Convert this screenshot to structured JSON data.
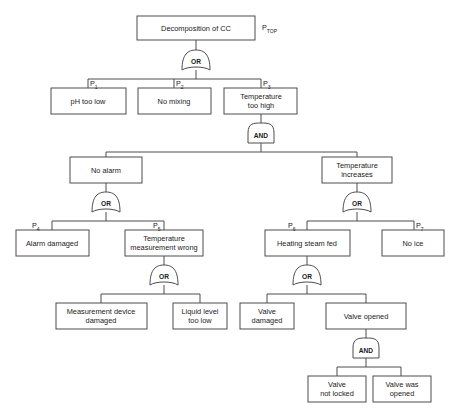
{
  "diagram": {
    "background_color": "#ffffff",
    "line_color": "#4c4c4c",
    "text_color": "#1a1a1a"
  },
  "gates": {
    "or_label": "OR",
    "and_label": "AND",
    "list": [
      {
        "id": "g-top",
        "type": "OR",
        "label": "OR"
      },
      {
        "id": "g-temp-too-high",
        "type": "AND",
        "label": "AND"
      },
      {
        "id": "g-no-alarm",
        "type": "OR",
        "label": "OR"
      },
      {
        "id": "g-temp-increases",
        "type": "OR",
        "label": "OR"
      },
      {
        "id": "g-temp-meas",
        "type": "OR",
        "label": "OR"
      },
      {
        "id": "g-heating-steam",
        "type": "OR",
        "label": "OR"
      },
      {
        "id": "g-valve-opened",
        "type": "AND",
        "label": "AND"
      }
    ]
  },
  "probability_labels": {
    "top": {
      "base": "P",
      "sub": "TOP",
      "text": "P TOP"
    },
    "p1": {
      "base": "P",
      "sub": "1",
      "text": "P 1"
    },
    "p2": {
      "base": "P",
      "sub": "2",
      "text": "P 2"
    },
    "p3": {
      "base": "P",
      "sub": "3",
      "text": "P 3"
    },
    "p4": {
      "base": "P",
      "sub": "4",
      "text": "P 4"
    },
    "p5": {
      "base": "P",
      "sub": "5",
      "text": "P 5"
    },
    "p6": {
      "base": "P",
      "sub": "6",
      "text": "P 6"
    },
    "p7": {
      "base": "P",
      "sub": "7",
      "text": "P 7"
    }
  },
  "nodes": {
    "top": {
      "id": "top",
      "lines": [
        "Decomposition of CC"
      ],
      "prob": "P TOP",
      "level": 0
    },
    "ph_too_low": {
      "id": "ph_too_low",
      "lines": [
        "pH too low"
      ],
      "prob": "P 1",
      "level": 1
    },
    "no_mixing": {
      "id": "no_mixing",
      "lines": [
        "No mixing"
      ],
      "prob": "P 2",
      "level": 1
    },
    "temp_too_high": {
      "id": "temp_too_high",
      "lines": [
        "Temperature",
        "too high"
      ],
      "prob": "P 3",
      "level": 1
    },
    "no_alarm": {
      "id": "no_alarm",
      "lines": [
        "No alarm"
      ],
      "prob": "",
      "level": 2
    },
    "temp_increases": {
      "id": "temp_increases",
      "lines": [
        "Temperature",
        "increases"
      ],
      "prob": "",
      "level": 2
    },
    "alarm_damaged": {
      "id": "alarm_damaged",
      "lines": [
        "Alarm damaged"
      ],
      "prob": "P 4",
      "level": 3
    },
    "temp_meas_wrong": {
      "id": "temp_meas_wrong",
      "lines": [
        "Temperature",
        "measurement wrong"
      ],
      "prob": "P 5",
      "level": 3
    },
    "heating_steam_fed": {
      "id": "heating_steam_fed",
      "lines": [
        "Heating steam fed"
      ],
      "prob": "P 6",
      "level": 3
    },
    "no_ice": {
      "id": "no_ice",
      "lines": [
        "No ice"
      ],
      "prob": "P 7",
      "level": 3
    },
    "meas_device_damaged": {
      "id": "meas_device_damaged",
      "lines": [
        "Measurement device",
        "damaged"
      ],
      "prob": "",
      "level": 4
    },
    "liquid_level_too_low": {
      "id": "liquid_level_too_low",
      "lines": [
        "Liquid level",
        "too low"
      ],
      "prob": "",
      "level": 4
    },
    "valve_damaged": {
      "id": "valve_damaged",
      "lines": [
        "Valve",
        "damaged"
      ],
      "prob": "",
      "level": 4
    },
    "valve_opened": {
      "id": "valve_opened",
      "lines": [
        "Valve opened"
      ],
      "prob": "",
      "level": 4
    },
    "valve_not_locked": {
      "id": "valve_not_locked",
      "lines": [
        "Valve",
        "not locked"
      ],
      "prob": "",
      "level": 5
    },
    "valve_was_opened": {
      "id": "valve_was_opened",
      "lines": [
        "Valve was",
        "opened"
      ],
      "prob": "",
      "level": 5
    }
  },
  "tree_structure": [
    {
      "parent": "top",
      "gate": "OR",
      "children": [
        "ph_too_low",
        "no_mixing",
        "temp_too_high"
      ]
    },
    {
      "parent": "temp_too_high",
      "gate": "AND",
      "children": [
        "no_alarm",
        "temp_increases"
      ]
    },
    {
      "parent": "no_alarm",
      "gate": "OR",
      "children": [
        "alarm_damaged",
        "temp_meas_wrong"
      ]
    },
    {
      "parent": "temp_meas_wrong",
      "gate": "OR",
      "children": [
        "meas_device_damaged",
        "liquid_level_too_low"
      ]
    },
    {
      "parent": "temp_increases",
      "gate": "OR",
      "children": [
        "heating_steam_fed",
        "no_ice"
      ]
    },
    {
      "parent": "heating_steam_fed",
      "gate": "OR",
      "children": [
        "valve_damaged",
        "valve_opened"
      ]
    },
    {
      "parent": "valve_opened",
      "gate": "AND",
      "children": [
        "valve_not_locked",
        "valve_was_opened"
      ]
    }
  ]
}
